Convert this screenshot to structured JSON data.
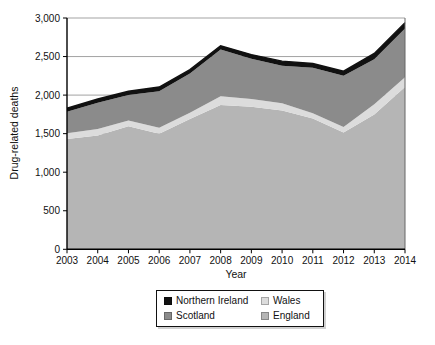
{
  "chart_data": {
    "type": "area",
    "stacked": true,
    "categories": [
      2003,
      2004,
      2005,
      2006,
      2007,
      2008,
      2009,
      2010,
      2011,
      2012,
      2013,
      2014
    ],
    "series": [
      {
        "name": "England",
        "color": "#b5b5b5",
        "values": [
          1430,
          1475,
          1595,
          1500,
          1690,
          1870,
          1850,
          1800,
          1695,
          1515,
          1750,
          2105
        ]
      },
      {
        "name": "Wales",
        "color": "#dcdcdc",
        "values": [
          75,
          85,
          75,
          75,
          80,
          115,
          100,
          95,
          70,
          70,
          130,
          125
        ]
      },
      {
        "name": "Scotland",
        "color": "#8b8b8b",
        "values": [
          280,
          340,
          330,
          475,
          510,
          605,
          520,
          485,
          590,
          665,
          585,
          635
        ]
      },
      {
        "name": "Northern Ireland",
        "color": "#111111",
        "values": [
          45,
          50,
          50,
          55,
          50,
          50,
          55,
          60,
          55,
          60,
          75,
          75
        ]
      }
    ],
    "stacked_totals": [
      1830,
      1950,
      2050,
      2105,
      2330,
      2640,
      2525,
      2440,
      2410,
      2310,
      2540,
      2940
    ],
    "xlabel": "Year",
    "ylabel": "Drug-related deaths",
    "ylim": [
      0,
      3000
    ],
    "ytick_step": 500,
    "ytick_labels": [
      "0",
      "500",
      "1,000",
      "1,500",
      "2,000",
      "2,500",
      "3,000"
    ],
    "grid": true,
    "legend_position": "bottom",
    "legend_rows": [
      [
        {
          "label": "Northern Ireland",
          "color": "#111111"
        },
        {
          "label": "Wales",
          "color": "#dcdcdc"
        }
      ],
      [
        {
          "label": "Scotland",
          "color": "#8b8b8b"
        },
        {
          "label": "England",
          "color": "#b5b5b5"
        }
      ]
    ],
    "colors": {
      "gridline": "#999999",
      "axis": "#000000",
      "plot_right_border": "#666666",
      "text": "#111111"
    }
  }
}
